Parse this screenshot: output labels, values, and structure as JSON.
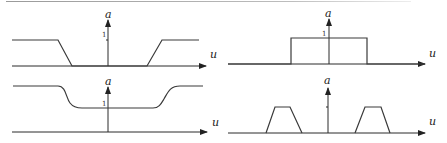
{
  "figure": {
    "panels": [
      {
        "id": "top-left",
        "description": "Band-stop trapezoidal response: value 1 outside, 0 in center band",
        "y_axis_label": "a",
        "x_axis_label": "u",
        "unit_tick_label": "1"
      },
      {
        "id": "top-right",
        "description": "Ideal rectangular band-pass response",
        "y_axis_label": "a",
        "x_axis_label": "u",
        "unit_tick_label": "1"
      },
      {
        "id": "bottom-left",
        "description": "Smooth band-stop response with nonzero floor",
        "y_axis_label": "a",
        "x_axis_label": "u",
        "unit_tick_label": "1"
      },
      {
        "id": "bottom-right",
        "description": "Two symmetric trapezoidal band-pass lobes",
        "y_axis_label": "a",
        "x_axis_label": "u",
        "unit_tick_label": ""
      }
    ],
    "colors": {
      "stroke": "#3a3a3a",
      "axis": "#2a2a2a",
      "background": "#ffffff"
    }
  }
}
